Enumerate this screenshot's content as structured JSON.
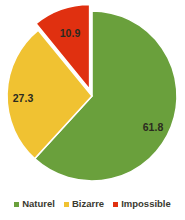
{
  "chart_data": {
    "type": "pie",
    "title": "",
    "categories": [
      "Naturel",
      "Bizarre",
      "Impossible"
    ],
    "values": [
      61.8,
      27.3,
      10.9
    ],
    "value_labels": [
      "61.8",
      "27.3",
      "10.9"
    ],
    "colors": [
      "#6aa03c",
      "#f0c232",
      "#e03010"
    ],
    "exploded": [
      false,
      false,
      true
    ],
    "start_angle_deg": 0,
    "direction": "clockwise",
    "legend_position": "bottom",
    "grid": false,
    "xlabel": "",
    "ylabel": ""
  },
  "legend": {
    "items": [
      {
        "label": "Naturel",
        "color": "#6aa03c"
      },
      {
        "label": "Bizarre",
        "color": "#f0c232"
      },
      {
        "label": "Impossible",
        "color": "#e03010"
      }
    ]
  },
  "labels": {
    "naturel_value": "61.8",
    "bizarre_value": "27.3",
    "impossible_value": "10.9"
  },
  "style": {
    "background": "#ffffff",
    "separator": "#ffffff",
    "label_text": "#2b2b20"
  }
}
